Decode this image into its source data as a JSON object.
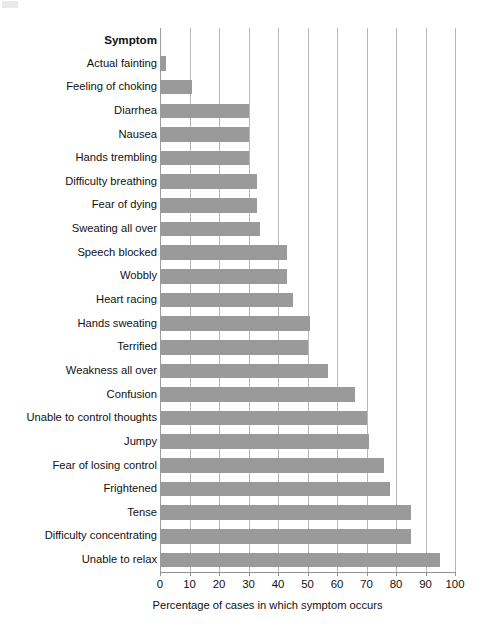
{
  "chart_data": {
    "type": "bar",
    "orientation": "horizontal",
    "title": "",
    "xlabel": "Percentage of cases in which symptom occurs",
    "ylabel": "Symptom",
    "xlim": [
      0,
      100
    ],
    "xticks": [
      0,
      10,
      20,
      30,
      40,
      50,
      60,
      70,
      80,
      90,
      100
    ],
    "xtick_labels": [
      "0",
      "10",
      "20",
      "30",
      "40",
      "50",
      "60",
      "70",
      "80",
      "90",
      "100"
    ],
    "grid": "vertical",
    "legend": "none",
    "bar_color": "#9a9a9a",
    "gridline_color": "#b8b8b8",
    "categories": [
      "Actual fainting",
      "Feeling of choking",
      "Diarrhea",
      "Nausea",
      "Hands trembling",
      "Difficulty breathing",
      "Fear of dying",
      "Sweating all over",
      "Speech blocked",
      "Wobbly",
      "Heart racing",
      "Hands sweating",
      "Terrified",
      "Weakness all over",
      "Confusion",
      "Unable to control thoughts",
      "Jumpy",
      "Fear of losing control",
      "Frightened",
      "Tense",
      "Difficulty concentrating",
      "Unable to relax"
    ],
    "values": [
      2,
      11,
      30,
      30,
      30,
      33,
      33,
      34,
      43,
      43,
      45,
      51,
      50,
      57,
      66,
      70,
      71,
      76,
      78,
      85,
      85,
      95
    ]
  },
  "header": {
    "column_label": "Symptom"
  },
  "axis": {
    "xlabel": "Percentage of cases in which symptom occurs"
  }
}
